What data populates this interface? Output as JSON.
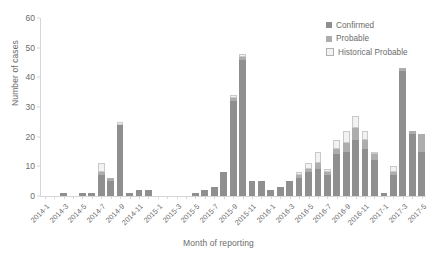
{
  "chart_data": {
    "type": "bar",
    "stacked": true,
    "title": "",
    "xlabel": "Month of reporting",
    "ylabel": "Number of cases",
    "ylim": [
      0,
      60
    ],
    "yticks": [
      0,
      10,
      20,
      30,
      40,
      50,
      60
    ],
    "grid": false,
    "legend_position": "top-right",
    "x_tick_label_step": 2,
    "categories": [
      "2014-1",
      "2014-2",
      "2014-3",
      "2014-4",
      "2014-5",
      "2014-6",
      "2014-7",
      "2014-8",
      "2014-9",
      "2014-10",
      "2014-11",
      "2014-12",
      "2015-1",
      "2015-2",
      "2015-3",
      "2015-4",
      "2015-5",
      "2015-6",
      "2015-7",
      "2015-8",
      "2015-9",
      "2015-10",
      "2015-11",
      "2015-12",
      "2016-1",
      "2016-2",
      "2016-3",
      "2016-4",
      "2016-5",
      "2016-6",
      "2016-7",
      "2016-8",
      "2016-9",
      "2016-10",
      "2016-11",
      "2016-12",
      "2017-1",
      "2017-2",
      "2017-3",
      "2017-4",
      "2017-5"
    ],
    "tick_labels": [
      "2014-1",
      "",
      "2014-3",
      "",
      "2014-5",
      "",
      "2014-7",
      "",
      "2014-9",
      "",
      "2014-11",
      "",
      "2015-1",
      "",
      "2015-3",
      "",
      "2015-5",
      "",
      "2015-7",
      "",
      "2015-9",
      "",
      "2015-11",
      "",
      "2016-1",
      "",
      "2016-3",
      "",
      "2016-5",
      "",
      "2016-7",
      "",
      "2016-9",
      "",
      "2016-11",
      "",
      "2017-1",
      "",
      "2017-3",
      "",
      "2017-5"
    ],
    "series": [
      {
        "name": "Confirmed",
        "color": "#8f8f8f",
        "values": [
          0,
          0,
          1,
          0,
          1,
          1,
          7,
          5,
          24,
          1,
          2,
          2,
          0,
          0,
          0,
          0,
          1,
          2,
          3,
          8,
          32,
          46,
          5,
          5,
          2,
          3,
          5,
          6,
          8,
          9,
          7,
          14,
          15,
          19,
          16,
          12,
          1,
          7,
          42,
          21,
          15
        ]
      },
      {
        "name": "Probable",
        "color": "#adadad",
        "values": [
          0,
          0,
          0,
          0,
          0,
          0,
          1,
          1,
          0,
          0,
          0,
          0,
          0,
          0,
          0,
          0,
          0,
          0,
          0,
          0,
          1,
          1,
          0,
          0,
          0,
          0,
          0,
          1,
          1,
          2,
          1,
          2,
          3,
          4,
          3,
          2,
          0,
          1,
          1,
          1,
          6
        ]
      },
      {
        "name": "Historical Probable",
        "color": "#dcdcdc",
        "values": [
          0,
          0,
          0,
          0,
          0,
          0,
          3,
          0,
          1,
          0,
          0,
          0,
          0,
          0,
          0,
          0,
          0,
          0,
          0,
          0,
          1,
          1,
          0,
          0,
          0,
          0,
          0,
          1,
          2,
          4,
          1,
          3,
          4,
          4,
          3,
          1,
          0,
          2,
          0,
          0,
          0
        ]
      }
    ]
  },
  "legend": {
    "items": [
      {
        "label": "Confirmed",
        "color": "#8f8f8f",
        "outlined": false
      },
      {
        "label": "Probable",
        "color": "#adadad",
        "outlined": false
      },
      {
        "label": "Historical Probable",
        "color": "#f2f2f2",
        "outlined": true
      }
    ]
  }
}
